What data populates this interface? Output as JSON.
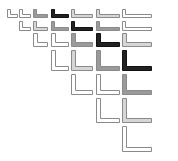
{
  "diagram": {
    "title": "",
    "colors": {
      "white": "#ffffff",
      "light": "#d6d6d6",
      "gray": "#9a9a9a",
      "black": "#222222",
      "stroke": "#8a8a8a"
    },
    "columns": [
      {
        "x": 7,
        "w": 11
      },
      {
        "x": 19,
        "w": 12
      },
      {
        "x": 33,
        "w": 15
      },
      {
        "x": 51,
        "w": 18
      },
      {
        "x": 71,
        "w": 22
      },
      {
        "x": 96,
        "w": 24
      },
      {
        "x": 122,
        "w": 30
      }
    ],
    "rows": [
      {
        "top": 9,
        "bottom": 18,
        "thick": 3,
        "cells": [
          "white",
          "white",
          "gray",
          "black",
          "light",
          "light",
          "white"
        ],
        "start": 0
      },
      {
        "top": 21,
        "bottom": 31,
        "thick": 3,
        "cells": [
          "white",
          "light",
          "gray",
          "black",
          "gray",
          "white"
        ],
        "start": 1
      },
      {
        "top": 33,
        "bottom": 47,
        "thick": 4,
        "cells": [
          "white",
          "white",
          "gray",
          "black",
          "light"
        ],
        "start": 2
      },
      {
        "top": 50,
        "bottom": 71,
        "thick": 4,
        "cells": [
          "white",
          "light",
          "gray",
          "black"
        ],
        "start": 3
      },
      {
        "top": 74,
        "bottom": 95,
        "thick": 4,
        "cells": [
          "white",
          "white",
          "gray"
        ],
        "start": 4
      },
      {
        "top": 98,
        "bottom": 123,
        "thick": 4,
        "cells": [
          "white",
          "light"
        ],
        "start": 5
      },
      {
        "top": 126,
        "bottom": 152,
        "thick": 4,
        "cells": [
          "white"
        ],
        "start": 6
      }
    ]
  }
}
